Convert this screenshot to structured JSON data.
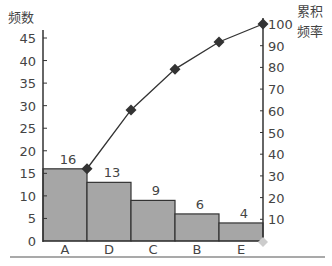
{
  "chart_data": {
    "type": "bar",
    "subtype": "pareto",
    "title": "",
    "xlabel": "",
    "ylabel": "频数",
    "y2label": [
      "累积",
      "频率"
    ],
    "categories": [
      "A",
      "D",
      "C",
      "B",
      "E"
    ],
    "series": [
      {
        "name": "频数",
        "type": "bar",
        "axis": "left",
        "values": [
          16,
          13,
          9,
          6,
          4
        ],
        "color": "#a6a6a6"
      },
      {
        "name": "累积频率",
        "type": "line",
        "axis": "right",
        "marker": "diamond",
        "values": [
          33.3,
          60.4,
          79.2,
          91.7,
          100
        ],
        "color": "#333333"
      }
    ],
    "ylim": [
      0,
      45
    ],
    "y_ticks": [
      0,
      5,
      10,
      15,
      20,
      25,
      30,
      35,
      40,
      45
    ],
    "y2lim": [
      0,
      100
    ],
    "y2_ticks": [
      10,
      20,
      30,
      40,
      50,
      60,
      70,
      80,
      90,
      100
    ],
    "data_labels": [
      "16",
      "13",
      "9",
      "6",
      "4"
    ],
    "grid": false,
    "legend": "none"
  },
  "axis": {
    "left_title": "频数",
    "right_title_line1": "累积",
    "right_title_line2": "频率"
  }
}
